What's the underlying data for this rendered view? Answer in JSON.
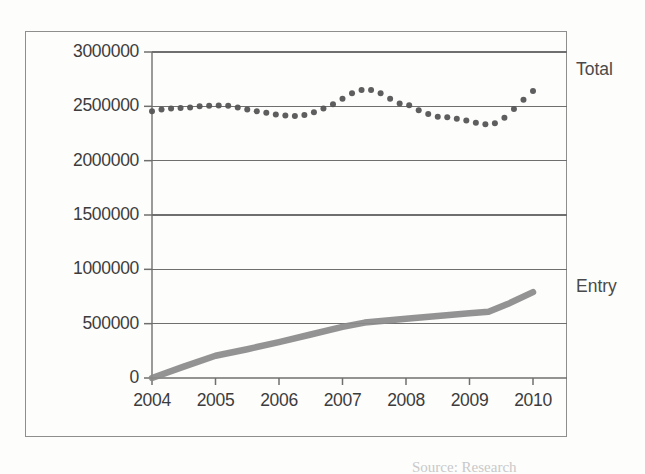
{
  "chart_data": {
    "type": "line",
    "title": "",
    "xlabel": "",
    "ylabel": "",
    "grid": true,
    "legend_position": "right",
    "xlim": [
      2003.75,
      2010.25
    ],
    "ylim": [
      0,
      3000000
    ],
    "yticks": [
      0,
      500000,
      1000000,
      1500000,
      2000000,
      2500000,
      3000000
    ],
    "ytick_labels": [
      "0",
      "500000",
      "1000000",
      "1500000",
      "2000000",
      "2500000",
      "3000000"
    ],
    "xticks": [
      2004,
      2005,
      2006,
      2007,
      2008,
      2009,
      2010
    ],
    "xtick_labels": [
      "2004",
      "2005",
      "2006",
      "2007",
      "2008",
      "2009",
      "2010"
    ],
    "series": [
      {
        "name": "Total",
        "style": "dotted-markers",
        "color": "#555555",
        "x": [
          2004.0,
          2004.15,
          2004.3,
          2004.45,
          2004.6,
          2004.75,
          2004.9,
          2005.05,
          2005.2,
          2005.35,
          2005.5,
          2005.65,
          2005.8,
          2005.95,
          2006.1,
          2006.25,
          2006.4,
          2006.55,
          2006.7,
          2006.85,
          2007.0,
          2007.15,
          2007.3,
          2007.45,
          2007.6,
          2007.75,
          2007.9,
          2008.05,
          2008.2,
          2008.35,
          2008.5,
          2008.65,
          2008.8,
          2008.95,
          2009.1,
          2009.25,
          2009.4,
          2009.55,
          2009.7,
          2009.85,
          2010.0
        ],
        "values": [
          2455000,
          2470000,
          2480000,
          2485000,
          2490000,
          2500000,
          2505000,
          2508000,
          2505000,
          2490000,
          2470000,
          2455000,
          2440000,
          2425000,
          2415000,
          2410000,
          2420000,
          2445000,
          2480000,
          2520000,
          2570000,
          2620000,
          2650000,
          2650000,
          2620000,
          2570000,
          2525000,
          2510000,
          2465000,
          2430000,
          2405000,
          2400000,
          2385000,
          2370000,
          2350000,
          2335000,
          2345000,
          2395000,
          2475000,
          2560000,
          2640000
        ]
      },
      {
        "name": "Entry",
        "style": "thick-line",
        "color": "#8a8a8a",
        "x": [
          2004.0,
          2004.5,
          2005.0,
          2005.5,
          2006.0,
          2006.5,
          2007.0,
          2007.35,
          2007.7,
          2008.0,
          2008.5,
          2009.0,
          2009.3,
          2009.6,
          2010.0
        ],
        "values": [
          0,
          105000,
          205000,
          265000,
          330000,
          400000,
          470000,
          510000,
          530000,
          545000,
          570000,
          595000,
          610000,
          680000,
          790000
        ]
      }
    ],
    "annotations": [
      {
        "text": "Total",
        "x": 2010.5,
        "y": 2830000
      },
      {
        "text": "Entry",
        "x": 2010.5,
        "y": 840000
      }
    ]
  },
  "legend": {
    "total_label": "Total",
    "entry_label": "Entry"
  },
  "footer": {
    "source_text": "Source: Research"
  }
}
